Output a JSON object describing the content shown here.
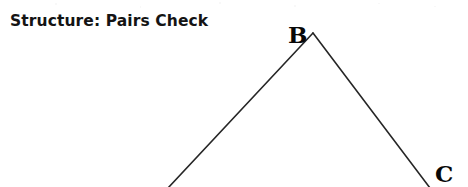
{
  "page": {
    "width": 468,
    "height": 187,
    "background_color": "#ffffff",
    "ink_color": "#1a1a1a"
  },
  "title": "Structure: Pairs Check",
  "diagram": {
    "name": "pairs-check-tree",
    "type": "inverted-v-branching",
    "stroke_color": "#262626",
    "stroke_width": 1.6,
    "apex_label": "B",
    "right_leaf_label": "C",
    "edges": [
      {
        "name": "left-branch",
        "from": "B",
        "to": "offscreen-bottom-left",
        "x1": 313,
        "y1": 33,
        "x2": 168,
        "y2": 188
      },
      {
        "name": "right-branch",
        "from": "B",
        "to": "C",
        "x1": 313,
        "y1": 33,
        "x2": 430,
        "y2": 188
      }
    ],
    "labels": [
      {
        "id": "B",
        "text": "B",
        "x": 288,
        "y": 23
      },
      {
        "id": "C",
        "text": "C",
        "x": 435,
        "y": 162
      }
    ]
  }
}
